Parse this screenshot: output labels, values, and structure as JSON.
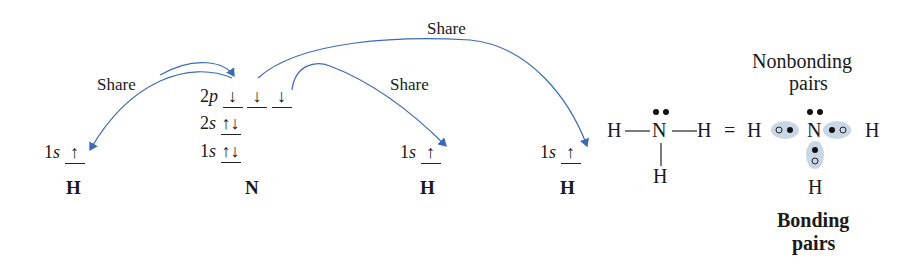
{
  "diagram": {
    "share_label": "Share",
    "hydrogen_left": {
      "orbital": "1s",
      "spin": "↑",
      "atom": "H"
    },
    "nitrogen": {
      "orbitals": [
        {
          "name": "2p",
          "spins": [
            "↓",
            "↓",
            "↓"
          ]
        },
        {
          "name": "2s",
          "spins": [
            "↑↓"
          ]
        },
        {
          "name": "1s",
          "spins": [
            "↑↓"
          ]
        }
      ],
      "atom": "N"
    },
    "hydrogen_middle": {
      "orbital": "1s",
      "spin": "↑",
      "atom": "H"
    },
    "hydrogen_right": {
      "orbital": "1s",
      "spin": "↑",
      "atom": "H"
    },
    "lewis": {
      "left_h": "H",
      "center_n": "N",
      "right_h": "H",
      "bottom_h": "H",
      "lone_pair": "••",
      "equals": "="
    },
    "dot_structure": {
      "left_h": "H",
      "center_n": "N",
      "right_h": "H",
      "bottom_h": "H",
      "nonbonding_label_line1": "Nonbonding",
      "nonbonding_label_line2": "pairs",
      "bonding_label_line1": "Bonding",
      "bonding_label_line2": "pairs"
    },
    "arrow_color": "#3b6bb5",
    "highlight_color": "#c9d6e6"
  }
}
